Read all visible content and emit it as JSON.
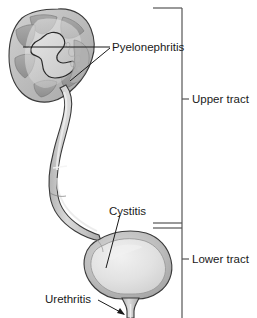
{
  "figure": {
    "background_color": "#ffffff",
    "outline_color": "#3a3a3a",
    "tissue_color": "#b9b9b9",
    "tissue_light": "#d8d8d8",
    "tissue_lighter": "#e8e8e8",
    "tissue_dark": "#9a9a9a",
    "label_color": "#1a1a1a",
    "bracket_color": "#555555"
  },
  "labels": {
    "pyelonephritis": "Pyelonephritis",
    "cystitis": "Cystitis",
    "urethritis": "Urethritis",
    "upper_tract": "Upper tract",
    "lower_tract": "Lower tract"
  },
  "structures": {
    "kidney": "kidney",
    "ureter": "ureter",
    "bladder": "bladder",
    "urethra": "urethra"
  },
  "brackets": [
    {
      "name": "upper-tract",
      "label": "Upper tract",
      "tick_y": 99
    },
    {
      "name": "lower-tract",
      "label": "Lower tract",
      "tick_y": 259
    }
  ]
}
